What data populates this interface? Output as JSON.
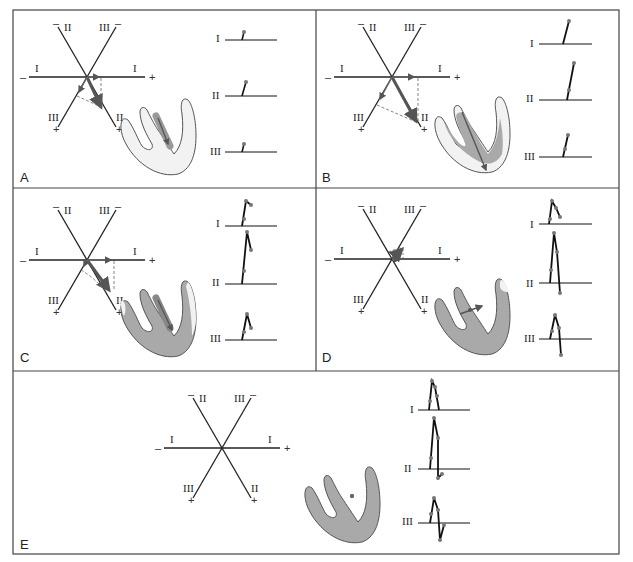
{
  "figure": {
    "type": "hexaxial-reference-diagram",
    "colors": {
      "frame": "#444444",
      "axis": "#222222",
      "vector": "#555555",
      "projection_dash": "#666666",
      "heart_outline": "#555555",
      "heart_unactivated": "#f2f2f2",
      "heart_activated": "#a9a9a9",
      "trace": "#111111",
      "trace_dot": "#777777"
    },
    "axis_labels": {
      "lead_I": "I",
      "lead_II": "II",
      "lead_III": "III",
      "plus": "+",
      "minus": "–"
    },
    "panels": [
      {
        "id": "A",
        "label": "A",
        "leads": [
          "I",
          "II",
          "III"
        ],
        "heart_state": "septal activation begins"
      },
      {
        "id": "B",
        "label": "B",
        "leads": [
          "I",
          "II",
          "III"
        ],
        "heart_state": "apical activation"
      },
      {
        "id": "C",
        "label": "C",
        "leads": [
          "I",
          "II",
          "III"
        ],
        "heart_state": "left ventricular free wall"
      },
      {
        "id": "D",
        "label": "D",
        "leads": [
          "I",
          "II",
          "III"
        ],
        "heart_state": "basal activation"
      },
      {
        "id": "E",
        "label": "E",
        "leads": [
          "I",
          "II",
          "III"
        ],
        "heart_state": "fully depolarized"
      }
    ],
    "caption": ""
  }
}
